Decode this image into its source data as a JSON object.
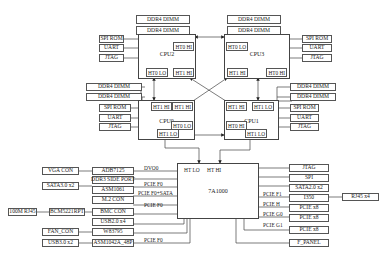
{
  "diagram": {
    "cpus": {
      "cpu2": {
        "label": "CPU2",
        "ports": {
          "ht0_hi": "HT0 HI",
          "ht0_lo": "HT0 LO",
          "ht1_hi": "HT1 HI"
        }
      },
      "cpu3": {
        "label": "CPU3",
        "ports": {
          "ht0_lo": "HT0 LO",
          "ht1_hi": "HT1 HI",
          "ht0_hi": "HT0 HI"
        }
      },
      "cpu0": {
        "label": "CPU0",
        "ports": {
          "ht1_hi": "HT1 HI",
          "ht1_hi2": "HT1 HI",
          "ht0_lo": "HT0 LO",
          "ht1_lo": "HT1 LO"
        }
      },
      "cpu1": {
        "label": "CPU1",
        "ports": {
          "ht1_hi": "HT1 HI",
          "ht1_lo": "HT1 LO",
          "ht0_hi": "HT0 HI",
          "ht1_lo2": "HT1 LO"
        }
      }
    },
    "cpu_peripherals": {
      "ddr": "DDR4 DIMM",
      "spi_rom": "SPI ROM",
      "uart": "UART",
      "jtag": "JTAG"
    },
    "bridge": {
      "label": "7A1000",
      "ht_lo": "HT LO",
      "ht_hi": "HT HI"
    },
    "left_devices": [
      {
        "chip": "ADB7125",
        "connector": "VGA CON",
        "bus": "DVO0"
      },
      {
        "chip": "DDR3 SIDE PORT",
        "connector": "",
        "bus": ""
      },
      {
        "chip": "ASM1061",
        "connector": "SATA3.0 x2",
        "bus": "PCIE F0"
      },
      {
        "chip": "M.2 CON",
        "connector": "",
        "bus": "PCIE F0+SATA"
      },
      {
        "chip": "BMC CON",
        "connector": "BCM5221RPT",
        "bus": "PCIE F0"
      },
      {
        "chip": "USB2.0 x4",
        "connector": "",
        "bus": ""
      },
      {
        "chip": "W83795",
        "connector": "FAN_CON",
        "bus": ""
      },
      {
        "chip": "ASM1042A_48P",
        "connector": "USB3.0 x2",
        "bus": "PCIE F0"
      }
    ],
    "extra_left": {
      "rj45": "100M RJ45"
    },
    "right_devices": [
      {
        "chip": "JTAG",
        "bus": ""
      },
      {
        "chip": "SPI",
        "bus": ""
      },
      {
        "chip": "SATA2.0 x2",
        "bus": ""
      },
      {
        "chip": "I350",
        "bus": "PCIE F1"
      },
      {
        "chip": "PCIE x8",
        "bus": "PCIE H"
      },
      {
        "chip": "PCIE x8",
        "bus": "PCIE G0"
      },
      {
        "chip": "PCIE x8",
        "bus": "PCIE G1"
      },
      {
        "chip": "F_PANEL",
        "bus": ""
      }
    ],
    "extra_right": {
      "rj45": "RJ45 x4"
    }
  }
}
